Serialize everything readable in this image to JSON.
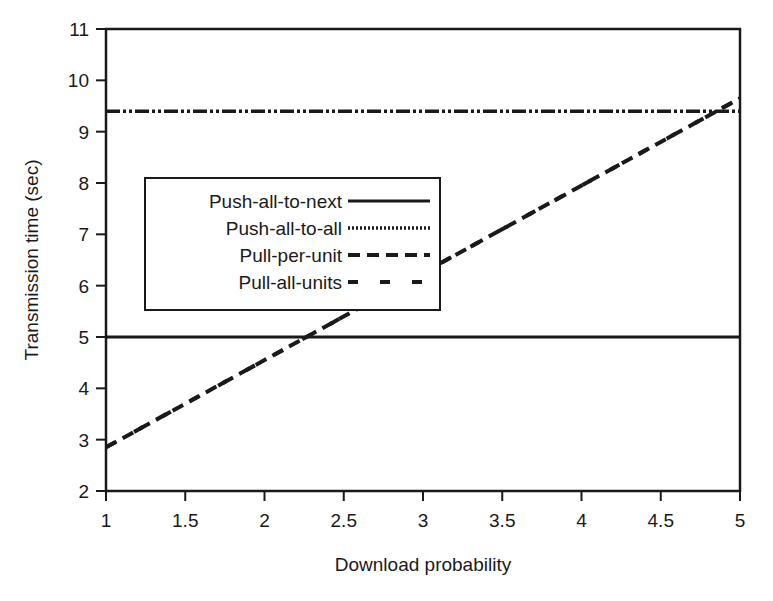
{
  "chart_data": {
    "type": "line",
    "title": "",
    "xlabel": "Download probability",
    "ylabel": "Transmission time (sec)",
    "xlim": [
      1,
      5
    ],
    "ylim": [
      2,
      11
    ],
    "x_ticks": [
      "1",
      "1.5",
      "2",
      "2.5",
      "3",
      "3.5",
      "4",
      "4.5",
      "5"
    ],
    "y_ticks": [
      "2",
      "3",
      "4",
      "5",
      "6",
      "7",
      "8",
      "9",
      "10",
      "11"
    ],
    "grid": false,
    "legend_position": "inside-left-middle",
    "series": [
      {
        "name": "Push-all-to-next",
        "style": "solid",
        "x": [
          1,
          5
        ],
        "y": [
          5.0,
          5.0
        ]
      },
      {
        "name": "Push-all-to-all",
        "style": "dash-dot-dot",
        "x": [
          1,
          5
        ],
        "y": [
          9.4,
          9.4
        ]
      },
      {
        "name": "Pull-per-unit",
        "style": "dashed",
        "x": [
          1,
          5
        ],
        "y": [
          2.85,
          9.65
        ]
      },
      {
        "name": "Pull-all-units",
        "style": "long-dashed",
        "x": [
          1,
          5
        ],
        "y": [
          2.85,
          9.65
        ]
      }
    ]
  },
  "axes": {
    "xlabel": "Download probability",
    "ylabel": "Transmission time (sec)"
  },
  "legend": {
    "items": [
      {
        "label": "Push-all-to-next"
      },
      {
        "label": "Push-all-to-all"
      },
      {
        "label": "Pull-per-unit"
      },
      {
        "label": "Pull-all-units"
      }
    ]
  }
}
